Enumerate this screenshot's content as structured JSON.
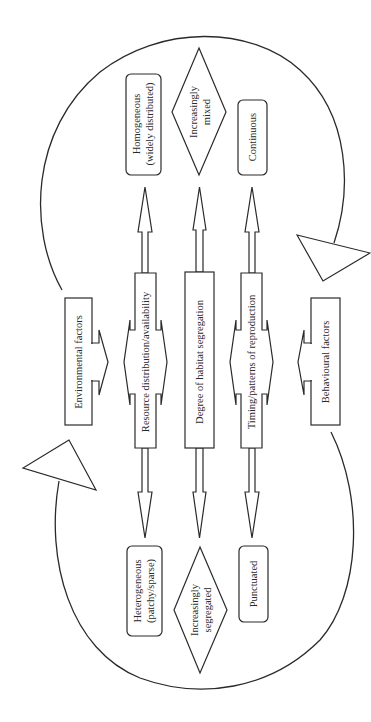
{
  "diagram": {
    "drivers": {
      "environmental": "Environmental factors",
      "behavioural": "Behavioural factors"
    },
    "axes": [
      {
        "label": "Resource distribution/availability",
        "top_end": {
          "line1": "Homogeneous",
          "line2": "(widely distributed)"
        },
        "bottom_end": {
          "line1": "Heterogeneous",
          "line2": "(patchy/sparse)"
        }
      },
      {
        "label": "Degree of habitat segregation",
        "top_end": {
          "line1": "Increasingly",
          "line2": "mixed"
        },
        "bottom_end": {
          "line1": "Increasingly",
          "line2": "segregated"
        }
      },
      {
        "label": "Timing/patterns of reproduction",
        "top_end": {
          "line1": "Continuous"
        },
        "bottom_end": {
          "line1": "Punctuated"
        }
      }
    ],
    "feedback_loops": [
      "top-loop",
      "bottom-loop"
    ],
    "colors": {
      "stroke": "#2a2a2a",
      "background": "#ffffff"
    }
  }
}
